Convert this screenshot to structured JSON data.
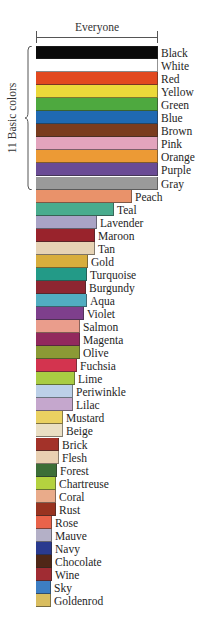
{
  "chart_data": {
    "type": "bar",
    "orientation": "horizontal",
    "title": "Everyone",
    "xlabel": "",
    "ylabel": "",
    "annotations": [
      {
        "text": "11 Basic colors",
        "type": "brace",
        "spans": [
          "Black",
          "Gray"
        ]
      },
      {
        "text": "Everyone",
        "type": "double-arrow",
        "spans": "full width"
      }
    ],
    "categories": [
      "Black",
      "White",
      "Red",
      "Yellow",
      "Green",
      "Blue",
      "Brown",
      "Pink",
      "Orange",
      "Purple",
      "Gray",
      "Peach",
      "Teal",
      "Lavender",
      "Maroon",
      "Tan",
      "Gold",
      "Turquoise",
      "Burgundy",
      "Aqua",
      "Violet",
      "Salmon",
      "Magenta",
      "Olive",
      "Fuchsia",
      "Lime",
      "Periwinkle",
      "Lilac",
      "Mustard",
      "Beige",
      "Brick",
      "Flesh",
      "Forest",
      "Chartreuse",
      "Coral",
      "Rust",
      "Rose",
      "Mauve",
      "Navy",
      "Chocolate",
      "Wine",
      "Sky",
      "Goldenrod"
    ],
    "values": [
      100,
      100,
      100,
      100,
      100,
      100,
      100,
      100,
      100,
      100,
      100,
      79,
      64,
      50,
      48,
      48,
      43,
      42,
      41,
      42,
      39,
      36,
      36,
      36,
      34,
      32,
      30,
      30,
      22,
      22,
      19,
      19,
      17,
      16,
      16,
      16,
      13,
      13,
      13,
      13,
      13,
      12,
      12
    ],
    "value_unit": "relative share of 'Everyone' (%), estimated from bar length",
    "xlim": [
      0,
      100
    ],
    "grid": false,
    "legend": "none (labels at bar ends)",
    "colors": [
      "#0a0a0a",
      "#ffffff",
      "#e2491f",
      "#ecd93a",
      "#4ea93f",
      "#1f69b2",
      "#7a3c1e",
      "#e3a4bd",
      "#ec9a35",
      "#6a4b95",
      "#9a9a9a",
      "#e9926a",
      "#49ac8e",
      "#a9a3c6",
      "#99232c",
      "#e6d3b5",
      "#d8ae3d",
      "#239a87",
      "#8e2631",
      "#51adc1",
      "#7e3f8c",
      "#ea9d8c",
      "#92295d",
      "#8b9a35",
      "#d3344f",
      "#a9cc43",
      "#bcd0e8",
      "#c5a7cd",
      "#ead161",
      "#eadfc4",
      "#a33229",
      "#e9d0b2",
      "#3c6e37",
      "#b4d23f",
      "#e9ab8a",
      "#983320",
      "#e9634a",
      "#b4b0c7",
      "#2a3a8f",
      "#4f2717",
      "#a02c33",
      "#3d7ec3",
      "#d9bd5f"
    ]
  },
  "header": {
    "label": "Everyone"
  },
  "brace": {
    "label": "11 Basic colors"
  }
}
